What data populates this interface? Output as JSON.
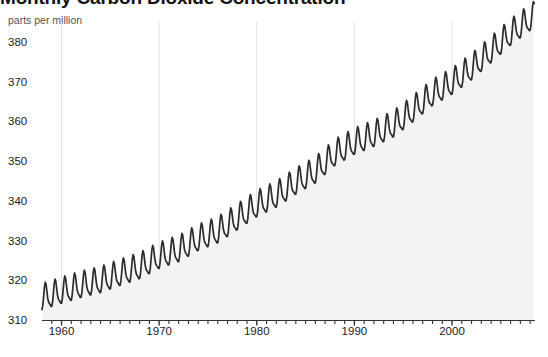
{
  "chart_data": {
    "type": "line",
    "title": "Monthly Carbon Dioxide Concentration",
    "subtitle": "parts per million",
    "xlabel": "",
    "ylabel": "parts per million",
    "grid": "vertical-only",
    "legend": "none",
    "fill": "area-below-curve",
    "xlim": [
      1958,
      2008.5
    ],
    "ylim": [
      310,
      385
    ],
    "x_ticks": [
      1960,
      1970,
      1980,
      1990,
      2000
    ],
    "x_tick_labels": [
      "1960",
      "1970",
      "1980",
      "1990",
      "2000"
    ],
    "x_minor_tick_interval": 1,
    "y_ticks": [
      310,
      320,
      330,
      340,
      350,
      360,
      370,
      380
    ],
    "y_tick_labels": [
      "310",
      "320",
      "330",
      "340",
      "350",
      "360",
      "370",
      "380"
    ],
    "series_name": "Monthly mean CO2 (Mauna Loa)",
    "x": [
      1958.5,
      1959.0,
      1959.5,
      1960.0,
      1960.5,
      1961.0,
      1961.5,
      1962.0,
      1962.5,
      1963.0,
      1963.5,
      1964.0,
      1964.5,
      1965.0,
      1965.5,
      1966.0,
      1966.5,
      1967.0,
      1967.5,
      1968.0,
      1968.5,
      1969.0,
      1969.5,
      1970.0,
      1970.5,
      1971.0,
      1971.5,
      1972.0,
      1972.5,
      1973.0,
      1973.5,
      1974.0,
      1974.5,
      1975.0,
      1975.5,
      1976.0,
      1976.5,
      1977.0,
      1977.5,
      1978.0,
      1978.5,
      1979.0,
      1979.5,
      1980.0,
      1980.5,
      1981.0,
      1981.5,
      1982.0,
      1982.5,
      1983.0,
      1983.5,
      1984.0,
      1984.5,
      1985.0,
      1985.5,
      1986.0,
      1986.5,
      1987.0,
      1987.5,
      1988.0,
      1988.5,
      1989.0,
      1989.5,
      1990.0,
      1990.5,
      1991.0,
      1991.5,
      1992.0,
      1992.5,
      1993.0,
      1993.5,
      1994.0,
      1994.5,
      1995.0,
      1995.5,
      1996.0,
      1996.5,
      1997.0,
      1997.5,
      1998.0,
      1998.5,
      1999.0,
      1999.5,
      2000.0,
      2000.5,
      2001.0,
      2001.5,
      2002.0,
      2002.5,
      2003.0,
      2003.5,
      2004.0,
      2004.5,
      2005.0,
      2005.5,
      2006.0,
      2006.5,
      2007.0,
      2007.5,
      2008.0
    ],
    "annual_mean_trend": {
      "years": [
        1958,
        1960,
        1962,
        1964,
        1966,
        1968,
        1970,
        1972,
        1974,
        1976,
        1978,
        1980,
        1982,
        1984,
        1986,
        1988,
        1990,
        1992,
        1994,
        1996,
        1998,
        2000,
        2002,
        2004,
        2006,
        2008
      ],
      "values": [
        315.3,
        316.9,
        318.4,
        319.6,
        321.4,
        323.1,
        325.7,
        327.4,
        330.2,
        332.1,
        335.4,
        338.7,
        341.1,
        344.4,
        347.2,
        351.6,
        354.4,
        356.4,
        358.8,
        362.6,
        366.7,
        369.5,
        373.2,
        377.5,
        381.9,
        385.6
      ]
    },
    "seasonal_amplitude_ppm": 6.2,
    "seasonal_peak_month": "May",
    "seasonal_min_month": "September"
  },
  "axis": {
    "y_unit_caption": "parts per million"
  }
}
